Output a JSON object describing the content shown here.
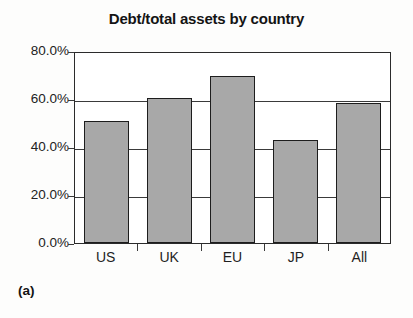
{
  "figure": {
    "title": "Debt/total assets by country",
    "caption": "(a)"
  },
  "chart_data": {
    "type": "bar",
    "title": "Debt/total assets by country",
    "xlabel": "",
    "ylabel": "",
    "categories": [
      "US",
      "UK",
      "EU",
      "JP",
      "All"
    ],
    "values": [
      51.0,
      60.5,
      69.5,
      43.0,
      58.5
    ],
    "value_labels": [
      "51.0%",
      "60.5%",
      "69.5%",
      "43.0%",
      "58.5%"
    ],
    "ylim": [
      0,
      80
    ],
    "ytick_values": [
      0,
      20,
      40,
      60,
      80
    ],
    "ytick_labels": [
      "0.0%",
      "20.0%",
      "40.0%",
      "60.0%",
      "80.0%"
    ],
    "grid": true,
    "legend": null,
    "bar_fill_color": "#a8a8a8",
    "bar_border_color": "#1d1d1d",
    "axis_color": "#2b2b2b",
    "background_color": "#ffffff"
  }
}
